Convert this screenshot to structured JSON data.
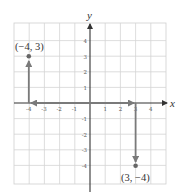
{
  "diagram": {
    "type": "coordinate-plane",
    "axes": {
      "x_label": "x",
      "y_label": "y"
    },
    "x_ticks": [
      "-4",
      "-3",
      "-2",
      "-1",
      "1",
      "2",
      "3",
      "4"
    ],
    "y_ticks": [
      "4",
      "3",
      "2",
      "1",
      "-1",
      "-2",
      "-3",
      "-4"
    ],
    "points": [
      {
        "label": "(−4, 3)",
        "x": -4,
        "y": 3
      },
      {
        "label": "(3, −4)",
        "x": 3,
        "y": -4
      }
    ],
    "paths": [
      {
        "description": "left along x-axis from origin to -4, then up to 3",
        "to": "(-4, 3)"
      },
      {
        "description": "right along x-axis from origin to 3, then down to -4",
        "to": "(3, -4)"
      }
    ],
    "colors": {
      "grid": "#d4d4d4",
      "axis": "#333333",
      "arrow": "#7a7a7a",
      "point": "#666666"
    }
  }
}
